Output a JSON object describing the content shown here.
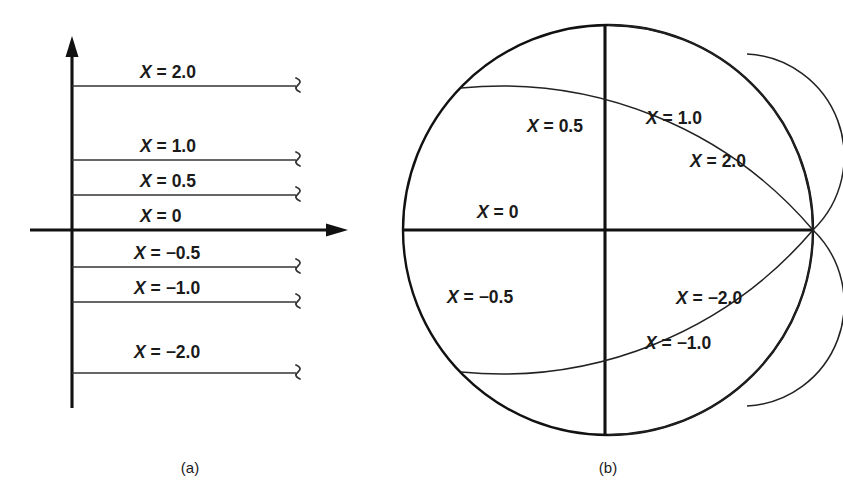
{
  "figure": {
    "background_color": "#ffffff",
    "ink_color": "#111111"
  },
  "panel_a": {
    "caption": "(a)",
    "description": "Constant-reactance horizontal lines in the complex impedance plane",
    "axes": {
      "vertical_axis_name": "imaginary-axis",
      "horizontal_axis_name": "real-axis",
      "vertical_arrow": "up",
      "horizontal_arrow": "right"
    },
    "lines": [
      {
        "label": "X = 2.0",
        "value": 2.0,
        "y": 86,
        "label_y": 72
      },
      {
        "label": "X = 1.0",
        "value": 1.0,
        "y": 160,
        "label_y": 146
      },
      {
        "label": "X = 0.5",
        "value": 0.5,
        "y": 195,
        "label_y": 181
      },
      {
        "label": "X = 0",
        "value": 0.0,
        "y": 230,
        "label_y": 216
      },
      {
        "label": "X = −0.5",
        "value": -0.5,
        "y": 267,
        "label_y": 253
      },
      {
        "label": "X = −1.0",
        "value": -1.0,
        "y": 302,
        "label_y": 288
      },
      {
        "label": "X = −2.0",
        "value": -2.0,
        "y": 373,
        "label_y": 351
      }
    ]
  },
  "panel_b": {
    "caption": "(b)",
    "description": "Constant-reactance arcs mapped onto the Smith chart unit circle",
    "unit_circle": {
      "cx": 608,
      "cy": 230,
      "r": 205
    },
    "arcs": [
      {
        "label": "X = 0.5",
        "value": 0.5,
        "label_x": 555,
        "label_y": 125
      },
      {
        "label": "X = 1.0",
        "value": 1.0,
        "label_x": 672,
        "label_y": 118
      },
      {
        "label": "X = 2.0",
        "value": 2.0,
        "label_x": 715,
        "label_y": 160
      },
      {
        "label": "X = 0",
        "value": 0.0,
        "label_x": 525,
        "label_y": 212
      },
      {
        "label": "X = −0.5",
        "value": -0.5,
        "label_x": 490,
        "label_y": 297
      },
      {
        "label": "X = −2.0",
        "value": -2.0,
        "label_x": 716,
        "label_y": 298
      },
      {
        "label": "X = −1.0",
        "value": -1.0,
        "label_x": 690,
        "label_y": 343
      }
    ]
  },
  "chart_data": {
    "type": "line",
    "xlabel": "",
    "ylabel": "",
    "panels": [
      {
        "name": "(a) impedance plane",
        "type": "line",
        "description": "Horizontal lines of constant reactance X, each drawn to the right of the imaginary axis and terminated with a break symbol.",
        "series": [
          {
            "name": "X = 2.0",
            "X": 2.0,
            "geometry": "horizontal line"
          },
          {
            "name": "X = 1.0",
            "X": 1.0,
            "geometry": "horizontal line"
          },
          {
            "name": "X = 0.5",
            "X": 0.5,
            "geometry": "horizontal line"
          },
          {
            "name": "X = 0",
            "X": 0.0,
            "geometry": "horizontal line (real axis)"
          },
          {
            "name": "X = −0.5",
            "X": -0.5,
            "geometry": "horizontal line"
          },
          {
            "name": "X = −1.0",
            "X": -1.0,
            "geometry": "horizontal line"
          },
          {
            "name": "X = −2.0",
            "X": -2.0,
            "geometry": "horizontal line"
          }
        ]
      },
      {
        "name": "(b) Smith chart",
        "type": "line",
        "description": "Arcs of circles centered at (1, 1/X) with radius 1/|X|, all passing through the point Γ = 1 on the unit circle.",
        "series": [
          {
            "name": "X = 0.5",
            "X": 0.5,
            "arc_center": [
              1.0,
              2.0
            ],
            "arc_radius": 2.0
          },
          {
            "name": "X = 1.0",
            "X": 1.0,
            "arc_center": [
              1.0,
              1.0
            ],
            "arc_radius": 1.0
          },
          {
            "name": "X = 2.0",
            "X": 2.0,
            "arc_center": [
              1.0,
              0.5
            ],
            "arc_radius": 0.5
          },
          {
            "name": "X = 0",
            "X": 0.0,
            "arc_center": null,
            "arc_radius": null
          },
          {
            "name": "X = −0.5",
            "X": -0.5,
            "arc_center": [
              1.0,
              -2.0
            ],
            "arc_radius": 2.0
          },
          {
            "name": "X = −1.0",
            "X": -1.0,
            "arc_center": [
              1.0,
              -1.0
            ],
            "arc_radius": 1.0
          },
          {
            "name": "X = −2.0",
            "X": -2.0,
            "arc_center": [
              1.0,
              -0.5
            ],
            "arc_radius": 0.5
          }
        ],
        "xlim": [
          -1,
          1
        ],
        "ylim": [
          -1,
          1
        ],
        "grid": false,
        "legend": "inline labels"
      }
    ]
  }
}
